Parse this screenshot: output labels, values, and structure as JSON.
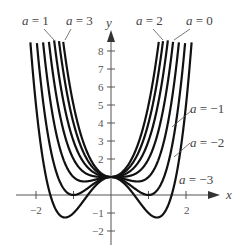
{
  "chart_data": {
    "type": "line",
    "title": "",
    "function": "y = x^4 + a x^2 + 1",
    "xlabel": "x",
    "ylabel": "y",
    "xlim": [
      -2.3,
      2.6
    ],
    "ylim": [
      -2.3,
      9.0
    ],
    "x_ticks": [
      -2,
      -1,
      1,
      2
    ],
    "x_tick_labels": [
      "-2",
      "2"
    ],
    "y_ticks": [
      -2,
      -1,
      1,
      2,
      3,
      4,
      5,
      6,
      7,
      8
    ],
    "y_tick_labels": [
      "-2",
      "-1",
      "2",
      "3",
      "4",
      "5",
      "6",
      "7",
      "8"
    ],
    "grid": false,
    "series": [
      {
        "name": "a = 3",
        "a": 3
      },
      {
        "name": "a = 2",
        "a": 2
      },
      {
        "name": "a = 1",
        "a": 1
      },
      {
        "name": "a = 0",
        "a": 0
      },
      {
        "name": "a = -1",
        "a": -1
      },
      {
        "name": "a = -2",
        "a": -2
      },
      {
        "name": "a = -3",
        "a": -3
      }
    ],
    "annotations": [
      "a = 1",
      "a = 3",
      "a = 2",
      "a = 0",
      "a = -1",
      "a = -2",
      "a = -3"
    ]
  },
  "labels": {
    "x_axis": "x",
    "y_axis": "y",
    "a1": "a = 1",
    "a3": "a = 3",
    "a2": "a = 2",
    "a0": "a = 0",
    "am1": "a = −1",
    "am2": "a = −2",
    "am3": "a = −3",
    "t_xm2": "−2",
    "t_x2": "2",
    "t_y8": "8",
    "t_y7": "7",
    "t_y6": "6",
    "t_y5": "5",
    "t_y4": "4",
    "t_y3": "3",
    "t_y2": "2",
    "t_ym1": "−1",
    "t_ym2": "−2"
  },
  "style": {
    "curve_color": "#111111",
    "axis_color": "#555555"
  }
}
